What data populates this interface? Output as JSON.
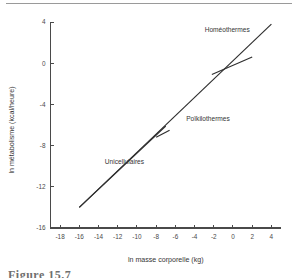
{
  "figure": {
    "caption": "Figure 15.7",
    "has_top_rule": true
  },
  "chart_data": {
    "type": "line",
    "title": "",
    "xlabel": "ln masse corporelle (kg)",
    "ylabel": "ln métabolisme (kcal/heure)",
    "xlim": [
      -19,
      5
    ],
    "ylim": [
      -16,
      4
    ],
    "grid": false,
    "legend": "none",
    "xticks": [
      -18,
      -16,
      -14,
      -12,
      -10,
      -8,
      -6,
      -4,
      -2,
      0,
      2,
      4
    ],
    "xticklabels": [
      "-18",
      "-16",
      "-14",
      "-12",
      "-10",
      "-8",
      "-6",
      "-4",
      "-2",
      "0",
      "2",
      "4"
    ],
    "yticks": [
      4,
      0,
      -4,
      -8,
      -12,
      -16
    ],
    "yticklabels": [
      "4",
      "0",
      "-4",
      "-8",
      "-12",
      "-16"
    ],
    "series": [
      {
        "name": "overall-regression",
        "points": [
          [
            -16.0,
            -14.0
          ],
          [
            4.0,
            3.8
          ]
        ]
      },
      {
        "name": "unicellulaires-segment",
        "points": [
          [
            -16.0,
            -14.0
          ],
          [
            -7.0,
            -6.1
          ]
        ]
      },
      {
        "name": "poikilothermes-segment",
        "points": [
          [
            -8.0,
            -7.2
          ],
          [
            -6.6,
            -6.5
          ]
        ]
      },
      {
        "name": "homeothermes-segment",
        "points": [
          [
            -2.2,
            -1.1
          ],
          [
            2.0,
            0.6
          ]
        ]
      }
    ],
    "annotations": [
      {
        "text": "Homéothermes",
        "x": -0.6,
        "y": 3.0
      },
      {
        "text": "Poïkilothermes",
        "x": -2.6,
        "y": -5.6
      },
      {
        "text": "Unicellulaires",
        "x": -11.3,
        "y": -9.8
      }
    ]
  },
  "colors": {
    "axis": "#4a4a4a",
    "line": "#2e2e2e",
    "text": "#353535",
    "rule": "#9a9a9a",
    "background": "#ffffff"
  }
}
